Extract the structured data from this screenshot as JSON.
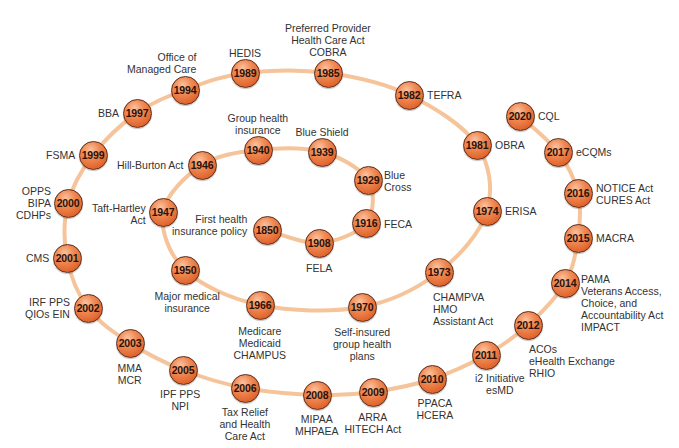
{
  "diagram": {
    "type": "timeline-spiral",
    "colors": {
      "node_fill": "#e8703a",
      "node_border": "#5a2a18",
      "path": "#f6c49b",
      "text": "#333333"
    },
    "nodes": [
      {
        "year": "1850",
        "x": 267,
        "y": 230,
        "label": "First health\ninsurance policy",
        "lx": 247,
        "ly": 213,
        "align": "left"
      },
      {
        "year": "1908",
        "x": 319,
        "y": 243,
        "label": "FELA",
        "lx": 319,
        "ly": 262,
        "align": "center"
      },
      {
        "year": "1916",
        "x": 366,
        "y": 223,
        "label": "FECA",
        "lx": 384,
        "ly": 218,
        "align": "right"
      },
      {
        "year": "1929",
        "x": 368,
        "y": 180,
        "label": "Blue\nCross",
        "lx": 384,
        "ly": 169,
        "align": "right"
      },
      {
        "year": "1939",
        "x": 322,
        "y": 152,
        "label": "Blue Shield",
        "lx": 322,
        "ly": 126,
        "align": "center"
      },
      {
        "year": "1940",
        "x": 258,
        "y": 150,
        "label": "Group health\ninsurance",
        "lx": 258,
        "ly": 112,
        "align": "center"
      },
      {
        "year": "1946",
        "x": 202,
        "y": 165,
        "label": "Hill-Burton Act",
        "lx": 184,
        "ly": 159,
        "align": "left"
      },
      {
        "year": "1947",
        "x": 163,
        "y": 212,
        "label": "Taft-Hartley\nAct",
        "lx": 146,
        "ly": 202,
        "align": "left"
      },
      {
        "year": "1950",
        "x": 185,
        "y": 270,
        "label": "Major medical\ninsurance",
        "lx": 187,
        "ly": 290,
        "align": "center"
      },
      {
        "year": "1966",
        "x": 260,
        "y": 305,
        "label": "Medicare\nMedicaid\nCHAMPUS",
        "lx": 260,
        "ly": 325,
        "align": "center"
      },
      {
        "year": "1970",
        "x": 362,
        "y": 307,
        "label": "Self-insured\ngroup health\nplans",
        "lx": 362,
        "ly": 326,
        "align": "center"
      },
      {
        "year": "1973",
        "x": 439,
        "y": 272,
        "label": "CHAMPVA\nHMO\nAssistant Act",
        "lx": 433,
        "ly": 291,
        "align": "right"
      },
      {
        "year": "1974",
        "x": 487,
        "y": 211,
        "label": "ERISA",
        "lx": 505,
        "ly": 205,
        "align": "right"
      },
      {
        "year": "1981",
        "x": 477,
        "y": 145,
        "label": "OBRA",
        "lx": 495,
        "ly": 139,
        "align": "right"
      },
      {
        "year": "1982",
        "x": 409,
        "y": 95,
        "label": "TEFRA",
        "lx": 427,
        "ly": 89,
        "align": "right"
      },
      {
        "year": "1985",
        "x": 328,
        "y": 73,
        "label": "Preferred Provider\nHealth Care Act\nCOBRA",
        "lx": 328,
        "ly": 22,
        "align": "center"
      },
      {
        "year": "1989",
        "x": 245,
        "y": 73,
        "label": "HEDIS",
        "lx": 245,
        "ly": 47,
        "align": "center"
      },
      {
        "year": "1994",
        "x": 185,
        "y": 90,
        "label": "Office of\nManaged Care",
        "lx": 196,
        "ly": 51,
        "align": "left"
      },
      {
        "year": "1997",
        "x": 137,
        "y": 113,
        "label": "BBA",
        "lx": 119,
        "ly": 107,
        "align": "left"
      },
      {
        "year": "1999",
        "x": 93,
        "y": 155,
        "label": "FSMA",
        "lx": 75,
        "ly": 149,
        "align": "left"
      },
      {
        "year": "2000",
        "x": 68,
        "y": 203,
        "label": "OPPS\nBIPA\nCDHPs",
        "lx": 51,
        "ly": 185,
        "align": "left"
      },
      {
        "year": "2001",
        "x": 67,
        "y": 258,
        "label": "CMS",
        "lx": 49,
        "ly": 252,
        "align": "left"
      },
      {
        "year": "2002",
        "x": 88,
        "y": 308,
        "label": "IRF PPS\nQIOs EIN",
        "lx": 70,
        "ly": 296,
        "align": "left"
      },
      {
        "year": "2003",
        "x": 130,
        "y": 343,
        "label": "MMA\nMCR",
        "lx": 130,
        "ly": 362,
        "align": "center"
      },
      {
        "year": "2005",
        "x": 183,
        "y": 370,
        "label": "IPF PPS\nNPI",
        "lx": 180,
        "ly": 388,
        "align": "center"
      },
      {
        "year": "2006",
        "x": 245,
        "y": 388,
        "label": "Tax Relief\nand Health\nCare Act",
        "lx": 245,
        "ly": 406,
        "align": "center"
      },
      {
        "year": "2008",
        "x": 317,
        "y": 395,
        "label": "MIPAA\nMHPAEA",
        "lx": 317,
        "ly": 413,
        "align": "center"
      },
      {
        "year": "2009",
        "x": 373,
        "y": 392,
        "label": "ARRA\nHITECH Act",
        "lx": 373,
        "ly": 411,
        "align": "center"
      },
      {
        "year": "2010",
        "x": 432,
        "y": 379,
        "label": "PPACA\nHCERA",
        "lx": 435,
        "ly": 397,
        "align": "center"
      },
      {
        "year": "2011",
        "x": 486,
        "y": 355,
        "label": "i2 Initiative\nesMD",
        "lx": 500,
        "ly": 372,
        "align": "center"
      },
      {
        "year": "2012",
        "x": 528,
        "y": 325,
        "label": "ACOs\neHealth Exchange\nRHIO",
        "lx": 529,
        "ly": 343,
        "align": "right"
      },
      {
        "year": "2014",
        "x": 565,
        "y": 283,
        "label": "PAMA\nVeterans Access,\nChoice, and\nAccountability Act\nIMPACT",
        "lx": 581,
        "ly": 273,
        "align": "right"
      },
      {
        "year": "2015",
        "x": 578,
        "y": 238,
        "label": "MACRA",
        "lx": 596,
        "ly": 232,
        "align": "right"
      },
      {
        "year": "2016",
        "x": 578,
        "y": 193,
        "label": "NOTICE Act\nCURES Act",
        "lx": 596,
        "ly": 182,
        "align": "right"
      },
      {
        "year": "2017",
        "x": 558,
        "y": 152,
        "label": "eCQMs",
        "lx": 576,
        "ly": 146,
        "align": "right"
      },
      {
        "year": "2020",
        "x": 520,
        "y": 116,
        "label": "CQL",
        "lx": 538,
        "ly": 110,
        "align": "right"
      }
    ]
  }
}
